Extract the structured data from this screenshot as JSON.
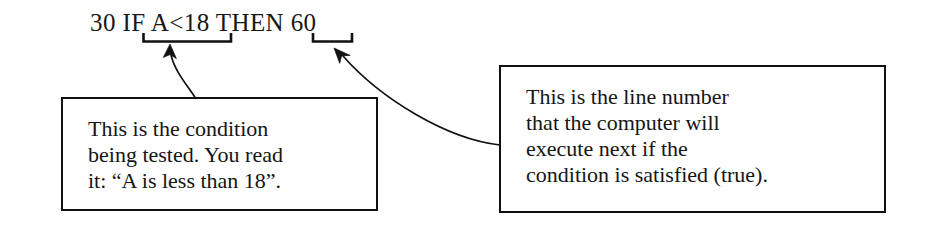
{
  "figure": {
    "kind": "annotated-code-line-diagram",
    "background_color": "#ffffff",
    "ink_color": "#111111"
  },
  "code_line": {
    "full_text": "30 IF A<18 THEN 60",
    "tokens": {
      "line_number": "30",
      "keyword_if": "IF",
      "condition": "A<18",
      "keyword_then": "THEN",
      "target_line": "60"
    },
    "spacer": " "
  },
  "braces": [
    {
      "name": "condition-brace",
      "spans": "A<18"
    },
    {
      "name": "target-line-brace",
      "spans": "60"
    }
  ],
  "callouts": [
    {
      "id": "condition",
      "target": "A<18",
      "lines": [
        "This is the condition",
        "being tested. You read",
        "it: “A is less than 18”."
      ],
      "text": "This is the condition\nbeing tested. You read\nit: “A is less than 18”."
    },
    {
      "id": "line-number",
      "target": "60",
      "lines": [
        "This is the line number",
        "that the computer will",
        "execute next if the",
        "condition is satisfied (true)."
      ],
      "text": "This is the line number\nthat the computer will\nexecute next if the\ncondition is satisfied (true)."
    }
  ]
}
